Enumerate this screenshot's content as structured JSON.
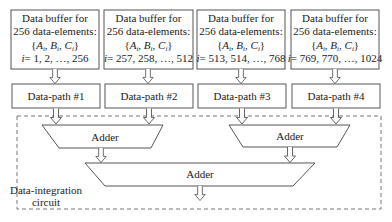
{
  "diagram": {
    "buffers": [
      {
        "line1": "Data buffer for",
        "line2": "256 data-elements:",
        "line3": "{A",
        "line3_rest": "i",
        "set_label": "{Ai, Bi, Ci}",
        "range_label": "i = 1, 2, …, 256",
        "range_values": "= 1, 2, …, 256"
      },
      {
        "line1": "Data buffer for",
        "line2": "256 data-elements:",
        "set_label": "{Ai, Bi, Ci}",
        "range_label": "i = 257, 258, …, 512",
        "range_values": "= 257, 258, …, 512"
      },
      {
        "line1": "Data buffer for",
        "line2": "256 data-elements:",
        "set_label": "{Ai, Bi, Ci}",
        "range_label": "i = 513, 514, …, 768",
        "range_values": "= 513, 514, …, 768"
      },
      {
        "line1": "Data buffer for",
        "line2": "256 data-elements:",
        "set_label": "{Ai, Bi, Ci}",
        "range_label": "i = 769, 770, …, 1024",
        "range_values": "= 769, 770, …, 1024"
      }
    ],
    "datapaths": [
      {
        "label": "Data-path #1"
      },
      {
        "label": "Data-path #2"
      },
      {
        "label": "Data-path #3"
      },
      {
        "label": "Data-path #4"
      }
    ],
    "adders": [
      {
        "label": "Adder"
      },
      {
        "label": "Adder"
      },
      {
        "label": "Adder"
      }
    ],
    "integration_circuit": {
      "line1": "Data-integration",
      "line2": "circuit"
    },
    "set_symbols": {
      "open": "{",
      "a": "A",
      "b": "B",
      "c": "C",
      "sub": "i",
      "sep": ", ",
      "close": "}",
      "i": "i"
    }
  }
}
